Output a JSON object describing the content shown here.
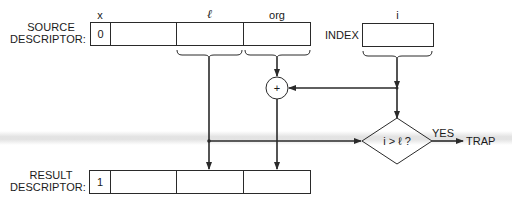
{
  "source_descriptor": {
    "label_line1": "SOURCE",
    "label_line2": "DESCRIPTOR:",
    "fields": [
      {
        "header": "x",
        "value": "0"
      },
      {
        "header": "",
        "value": ""
      },
      {
        "header": "ℓ",
        "value": ""
      },
      {
        "header": "org",
        "value": ""
      }
    ]
  },
  "index": {
    "label": "INDEX",
    "header": "i",
    "value": ""
  },
  "adder": {
    "symbol": "+"
  },
  "decision": {
    "condition": "i > ℓ ?",
    "yes_label": "YES",
    "yes_target": "TRAP"
  },
  "result_descriptor": {
    "label_line1": "RESULT",
    "label_line2": "DESCRIPTOR:",
    "fields": [
      {
        "value": "1"
      },
      {
        "value": ""
      },
      {
        "value": ""
      },
      {
        "value": ""
      }
    ]
  },
  "colors": {
    "line": "#2a2a2a",
    "band": "#dedede",
    "background": "#ffffff"
  }
}
